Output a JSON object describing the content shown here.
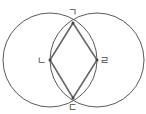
{
  "diagram": {
    "title": "",
    "circles": [
      {
        "name": "left-circle",
        "cx": 50,
        "cy": 60,
        "r": 47
      },
      {
        "name": "right-circle",
        "cx": 97,
        "cy": 60,
        "r": 47
      }
    ],
    "points": {
      "top": {
        "label": "ㄱ",
        "x": 73,
        "y": 23
      },
      "left": {
        "label": "ㄴ",
        "x": 50,
        "y": 60
      },
      "bottom": {
        "label": "ㄷ",
        "x": 73,
        "y": 98
      },
      "right": {
        "label": "ㄹ",
        "x": 97,
        "y": 60
      }
    },
    "colors": {
      "stroke": "#555555",
      "rhombus": "#666666"
    }
  }
}
